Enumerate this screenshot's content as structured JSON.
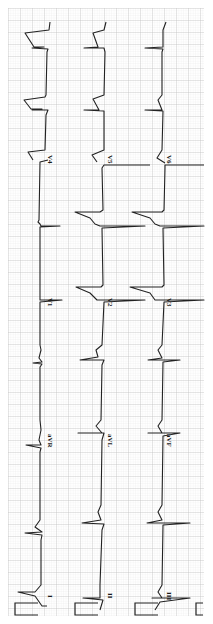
{
  "figure": {
    "type": "12-lead electrocardiogram",
    "orientation": "rotated 90 degrees clockwise",
    "paper_color": "#ffffff",
    "grid_minor_color": "#d9d9d9",
    "grid_major_color": "#bdbdbd",
    "trace_color": "#222222"
  },
  "columns": [
    {
      "name": "column-1",
      "leads": [
        "I",
        "aVR",
        "V1",
        "V4"
      ]
    },
    {
      "name": "column-2",
      "leads": [
        "II",
        "aVL",
        "V2",
        "V5"
      ]
    },
    {
      "name": "column-3",
      "leads": [
        "III",
        "aVF",
        "V3",
        "V6"
      ]
    }
  ],
  "labels": {
    "I": "I",
    "II": "II",
    "III": "III",
    "aVR": "aVR",
    "aVL": "aVL",
    "aVF": "aVF",
    "V1": "V1",
    "V2": "V2",
    "V3": "V3",
    "V4": "V4",
    "V5": "V5",
    "V6": "V6"
  },
  "calibration_pulses": 3
}
